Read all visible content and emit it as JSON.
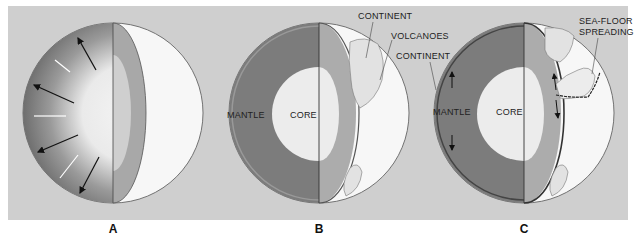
{
  "figure": {
    "panels": [
      {
        "id": "A",
        "caption": "A",
        "labels": []
      },
      {
        "id": "B",
        "caption": "B",
        "labels": [
          "MANTLE",
          "CORE",
          "CONTINENT",
          "VOLCANOES",
          "CONTINENT"
        ]
      },
      {
        "id": "C",
        "caption": "C",
        "labels": [
          "MANTLE",
          "CORE",
          "SEA-FLOOR",
          "SPREADING"
        ]
      }
    ],
    "colors": {
      "background": "#cfcfcf",
      "mantle_dark": "#7a7a7a",
      "mantle_cut": "#a8a8a8",
      "core": "#ececec",
      "surface": "#f7f7f7"
    }
  }
}
